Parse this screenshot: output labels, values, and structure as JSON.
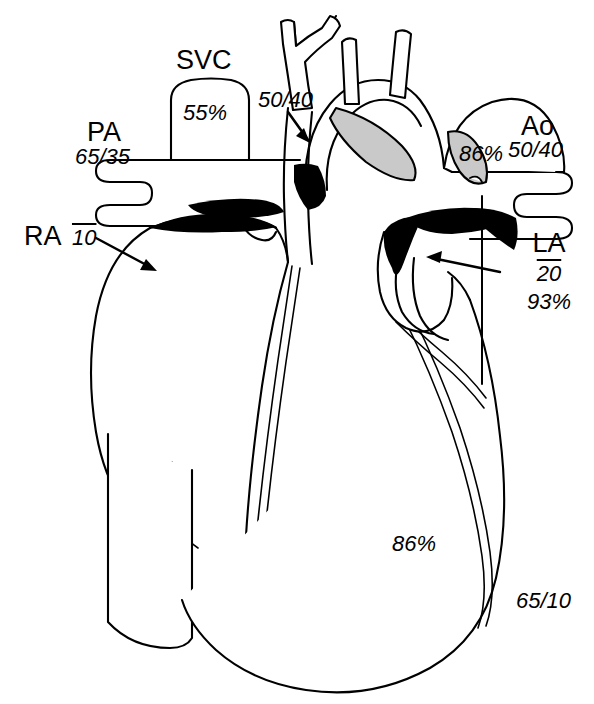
{
  "figure": {
    "width": 594,
    "height": 704,
    "background_color": "#ffffff",
    "line_color": "#000000",
    "fill_black": "#000000",
    "fill_gray": "#c9c9c9"
  },
  "labels": {
    "svc": {
      "name": "SVC",
      "saturation": "55%"
    },
    "pa": {
      "name": "PA",
      "pressure": "65/35"
    },
    "ra": {
      "name": "RA",
      "mean_pressure": "10"
    },
    "pulmonary_artery_arrow": {
      "pressure": "50/40"
    },
    "ao": {
      "name": "Ao",
      "pressure": "50/40",
      "saturation": "86%"
    },
    "la": {
      "name": "LA",
      "mean_pressure": "20",
      "saturation": "93%"
    },
    "lv": {
      "saturation": "86%",
      "pressure": "65/10"
    }
  },
  "annotation_list": [
    {
      "id": "svc-name",
      "text": "SVC",
      "style": "upright",
      "size": 27
    },
    {
      "id": "svc-sat",
      "text": "55%",
      "style": "italic",
      "size": 22
    },
    {
      "id": "pa-name",
      "text": "PA",
      "style": "upright",
      "size": 27
    },
    {
      "id": "pa-pressure",
      "text": "65/35",
      "style": "italic",
      "size": 22
    },
    {
      "id": "arrow-pressure",
      "text": "50/40",
      "style": "italic",
      "size": 22
    },
    {
      "id": "ra-name",
      "text": "RA",
      "style": "upright",
      "size": 27
    },
    {
      "id": "ra-mean",
      "text": "10",
      "style": "italic",
      "size": 22
    },
    {
      "id": "ao-name",
      "text": "Ao",
      "style": "upright",
      "size": 27
    },
    {
      "id": "ao-pressure",
      "text": "50/40",
      "style": "italic",
      "size": 22
    },
    {
      "id": "ao-sat",
      "text": "86%",
      "style": "italic",
      "size": 22
    },
    {
      "id": "la-name",
      "text": "LA",
      "style": "upright",
      "size": 27
    },
    {
      "id": "la-mean",
      "text": "20",
      "style": "italic",
      "size": 22
    },
    {
      "id": "la-sat",
      "text": "93%",
      "style": "italic",
      "size": 22
    },
    {
      "id": "lv-sat",
      "text": "86%",
      "style": "italic",
      "size": 22
    },
    {
      "id": "lv-pressure",
      "text": "65/10",
      "style": "italic",
      "size": 22
    }
  ]
}
